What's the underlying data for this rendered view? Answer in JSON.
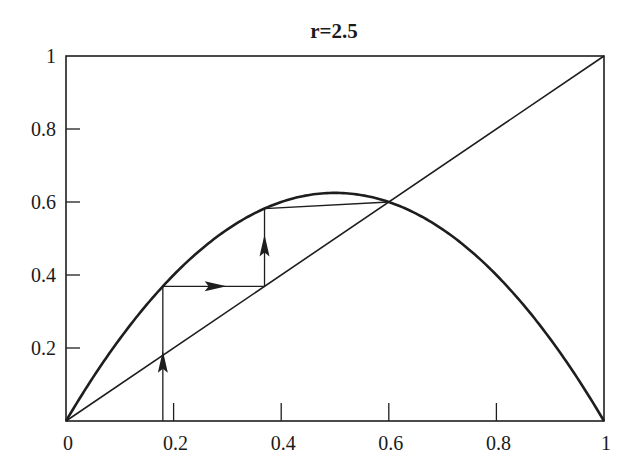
{
  "chart_data": {
    "type": "line",
    "title": "r=2.5",
    "xlabel": "",
    "ylabel": "",
    "xlim": [
      0,
      1
    ],
    "ylim": [
      0,
      1
    ],
    "grid": false,
    "legend": null,
    "x_ticks": [
      0,
      0.2,
      0.4,
      0.6,
      0.8,
      1
    ],
    "x_tick_labels": [
      "0",
      "0.2",
      "0.4",
      "0.6",
      "0.8",
      "1"
    ],
    "y_ticks": [
      0.2,
      0.4,
      0.6,
      0.8,
      1
    ],
    "y_tick_labels": [
      "0.2",
      "0.4",
      "0.6",
      "0.8",
      "1"
    ],
    "series": [
      {
        "name": "logistic map f(x) = r x (1 - x)",
        "r": 2.5,
        "x": [
          0,
          0.1,
          0.2,
          0.3,
          0.4,
          0.5,
          0.6,
          0.7,
          0.8,
          0.9,
          1.0
        ],
        "y": [
          0,
          0.225,
          0.4,
          0.525,
          0.6,
          0.625,
          0.6,
          0.525,
          0.4,
          0.225,
          0
        ]
      },
      {
        "name": "identity y = x",
        "x": [
          0,
          1
        ],
        "y": [
          0,
          1
        ]
      },
      {
        "name": "cobweb iteration",
        "x": [
          0.18,
          0.18,
          0.369,
          0.369,
          0.6
        ],
        "y": [
          0,
          0.369,
          0.369,
          0.582,
          0.6
        ]
      }
    ],
    "annotations": [
      "upward arrow on vertical segment at x=0.18",
      "rightward arrow on horizontal segment at y=0.369",
      "upward arrow on vertical segment at x=0.369",
      "rightward arrow on horizontal segment at y=0.582",
      "fixed point at x=0.6"
    ]
  },
  "plot": {
    "left": 66,
    "right": 604,
    "top": 56,
    "bottom": 421
  }
}
